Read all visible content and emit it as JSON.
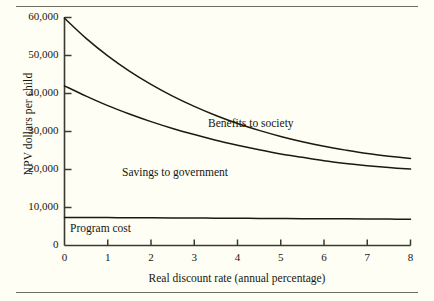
{
  "chart_data": {
    "type": "line",
    "title": "",
    "xlabel": "Real discount rate (annual percentage)",
    "ylabel": "NPV dollars per child",
    "xlim": [
      0,
      8
    ],
    "ylim": [
      0,
      60000
    ],
    "grid": false,
    "legend_position": "inline-annotations",
    "xticks": [
      "0",
      "1",
      "2",
      "3",
      "4",
      "5",
      "6",
      "7",
      "8"
    ],
    "xtick_values": [
      0,
      1,
      2,
      3,
      4,
      5,
      6,
      7,
      8
    ],
    "yticks": [
      "0",
      "10,000",
      "20,000",
      "30,000",
      "40,000",
      "50,000",
      "60,000"
    ],
    "ytick_values": [
      0,
      10000,
      20000,
      30000,
      40000,
      50000,
      60000
    ],
    "x": [
      0,
      0.5,
      1,
      1.5,
      2,
      2.5,
      3,
      3.5,
      4,
      4.5,
      5,
      5.5,
      6,
      6.5,
      7,
      7.5,
      8
    ],
    "series": [
      {
        "name": "Benefits to society",
        "values": [
          59800,
          54500,
          49900,
          45900,
          42400,
          39300,
          36600,
          34200,
          32100,
          30300,
          28700,
          27300,
          26100,
          25100,
          24200,
          23500,
          22900
        ]
      },
      {
        "name": "Savings to government",
        "values": [
          42000,
          39300,
          36800,
          34600,
          32600,
          30800,
          29200,
          27700,
          26400,
          25200,
          24100,
          23200,
          22300,
          21600,
          21000,
          20500,
          20100
        ]
      },
      {
        "name": "Program cost",
        "values": [
          7400,
          7370,
          7340,
          7310,
          7280,
          7250,
          7220,
          7190,
          7160,
          7130,
          7100,
          7070,
          7040,
          7010,
          6980,
          6950,
          6920
        ]
      }
    ],
    "annotations": [
      {
        "text": "Benefits to society",
        "x": 3.3,
        "y": 34500
      },
      {
        "text": "Savings to government",
        "x": 1.35,
        "y": 21500
      },
      {
        "text": "Program cost",
        "x": 0.15,
        "y": 6200
      }
    ],
    "colors": {
      "background": "#fefef5",
      "line": "#1a1a12",
      "axis": "#3a3a2e",
      "rule": "#6d6d61",
      "text": "#16160f"
    }
  }
}
